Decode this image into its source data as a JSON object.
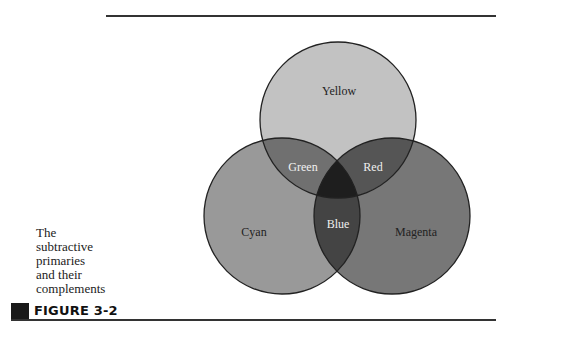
{
  "caption": {
    "lines": [
      "The",
      "subtractive",
      "primaries",
      "and their",
      "complements"
    ]
  },
  "figure": {
    "label": "FIGURE 3-2"
  },
  "diagram": {
    "type": "venn",
    "title": "The subtractive primaries and their complements",
    "circles": [
      {
        "name": "Yellow",
        "cx": 338,
        "cy": 120,
        "r": 78,
        "fill": "#c2c2c2"
      },
      {
        "name": "Cyan",
        "cx": 282,
        "cy": 216,
        "r": 78,
        "fill": "#999999"
      },
      {
        "name": "Magenta",
        "cx": 392,
        "cy": 216,
        "r": 78,
        "fill": "#777777"
      }
    ],
    "regions": {
      "yellow": {
        "label": "Yellow",
        "color": "#222222"
      },
      "cyan": {
        "label": "Cyan",
        "color": "#222222"
      },
      "magenta": {
        "label": "Magenta",
        "color": "#222222"
      },
      "green": {
        "label": "Green",
        "fill": "#707070",
        "color": "#f0f0f0"
      },
      "red": {
        "label": "Red",
        "fill": "#555555",
        "color": "#f0f0f0"
      },
      "blue": {
        "label": "Blue",
        "fill": "#444444",
        "color": "#f0f0f0"
      },
      "center": {
        "fill": "#1e1e1e"
      }
    },
    "stroke": "#222222"
  }
}
